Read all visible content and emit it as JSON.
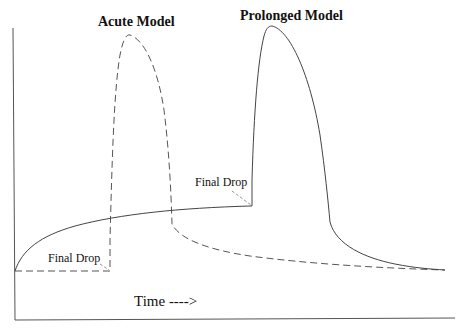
{
  "diagram": {
    "type": "conceptual-curve-diagram",
    "labels": {
      "acute_model": "Acute Model",
      "prolonged_model": "Prolonged Model",
      "final_drop_left": "Final Drop",
      "final_drop_right": "Final Drop",
      "x_axis": "Time ---->"
    },
    "series": [
      {
        "name": "Acute Model",
        "style": "dashed",
        "description": "Flat baseline, final drop then sharp rise to a peak, rapid fall, then gradual decay back to baseline"
      },
      {
        "name": "Prolonged Model",
        "style": "solid",
        "description": "Gradual logarithmic rise from baseline, final drop then sharp rise to a later peak, rapid fall, then gradual decay back to baseline"
      }
    ],
    "colors": {
      "line": "#444444",
      "text": "#111111",
      "background": "#ffffff"
    }
  }
}
